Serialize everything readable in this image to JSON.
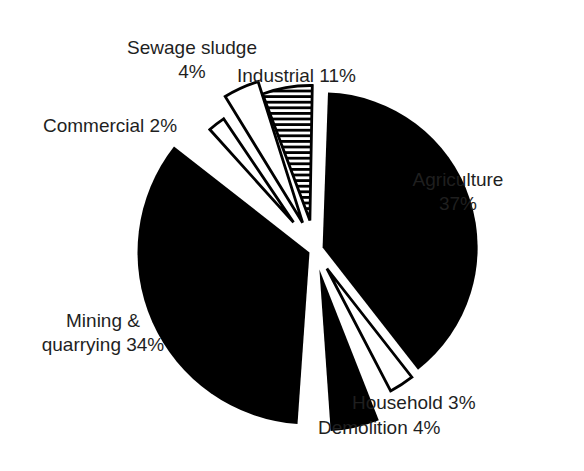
{
  "chart_data": {
    "type": "pie",
    "title": "",
    "unit": "%",
    "categories": [
      "Agriculture",
      "Household",
      "Demolition",
      "Mining & quarrying",
      "Commercial",
      "Sewage sludge",
      "Industrial"
    ],
    "values": [
      37,
      3,
      4,
      34,
      2,
      4,
      11
    ],
    "slices": [
      {
        "label": "Agriculture",
        "value": 37,
        "fill": "#000000",
        "style": "solid",
        "start": 2,
        "end": 142,
        "radius": 155,
        "explode": 8
      },
      {
        "label": "Household",
        "value": 3,
        "fill": "#ffffff",
        "style": "outlined-white",
        "start": 142,
        "end": 152.5,
        "radius": 138,
        "explode": 22
      },
      {
        "label": "Demolition",
        "value": 4,
        "fill": "#000000",
        "style": "solid",
        "start": 158.5,
        "end": 176,
        "radius": 162,
        "explode": 20
      },
      {
        "label": "Mining & quarrying",
        "value": 34,
        "fill": "#000000",
        "style": "solid",
        "start": 184,
        "end": 308,
        "radius": 172,
        "explode": 6
      },
      {
        "label": "Commercial",
        "value": 2,
        "fill": "#ffffff",
        "style": "outlined-white",
        "start": 318,
        "end": 326,
        "radius": 125,
        "explode": 35
      },
      {
        "label": "Sewage sludge",
        "value": 4,
        "fill": "#ffffff",
        "style": "outlined-white",
        "start": 328.5,
        "end": 342.5,
        "radius": 148,
        "explode": 30
      },
      {
        "label": "Industrial",
        "value": 11,
        "fill": "horizontal-stripes",
        "style": "striped",
        "start": 339.5,
        "end": 361,
        "radius": 135,
        "explode": 30
      }
    ],
    "layout": {
      "center_x": 315,
      "center_y": 250,
      "background": "#ffffff",
      "ink_color": "#000000",
      "legend": "none",
      "label_style": "free-text-around-pie",
      "exploded": true
    }
  },
  "labels": {
    "sewage": {
      "line1": "Sewage sludge",
      "line2": "4%"
    },
    "industrial": {
      "text": "Industrial 11%"
    },
    "commercial": {
      "text": "Commercial 2%"
    },
    "agriculture": {
      "line1": "Agriculture",
      "line2": "37%"
    },
    "mining": {
      "line1": "Mining &",
      "line2": "quarrying 34%"
    },
    "household": {
      "text": "Household 3%"
    },
    "demolition": {
      "text": "Demolition 4%"
    }
  }
}
